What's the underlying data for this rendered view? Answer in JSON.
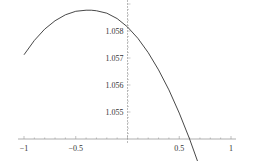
{
  "chart_data": {
    "type": "line",
    "title": "",
    "xlabel": "",
    "ylabel": "",
    "xlim": [
      -1,
      1
    ],
    "ylim": [
      1.054,
      1.0591
    ],
    "grid": false,
    "legend": null,
    "axes_origin": [
      0,
      1.054
    ],
    "x_ticks": [
      {
        "value": -1,
        "label": "-1"
      },
      {
        "value": -0.5,
        "label": "-0.5"
      },
      {
        "value": 0.5,
        "label": "0.5"
      },
      {
        "value": 1,
        "label": "1"
      }
    ],
    "y_ticks": [
      {
        "value": 1.055,
        "label": "1.055"
      },
      {
        "value": 1.056,
        "label": "1.056"
      },
      {
        "value": 1.057,
        "label": "1.057"
      },
      {
        "value": 1.058,
        "label": "1.058"
      }
    ],
    "series": [
      {
        "name": "f(x)",
        "color": "#333333",
        "x": [
          -1,
          -0.9,
          -0.8,
          -0.7,
          -0.6,
          -0.5,
          -0.4,
          -0.35,
          -0.3,
          -0.2,
          -0.1,
          0,
          0.1,
          0.2,
          0.3,
          0.4,
          0.5,
          0.6,
          0.7,
          0.74
        ],
        "y": [
          1.05712,
          1.05765,
          1.05807,
          1.05838,
          1.0586,
          1.05873,
          1.05877,
          1.05877,
          1.05875,
          1.05866,
          1.05846,
          1.05815,
          1.05773,
          1.0572,
          1.05656,
          1.05582,
          1.05496,
          1.054,
          1.05293,
          1.0524
        ]
      }
    ]
  }
}
